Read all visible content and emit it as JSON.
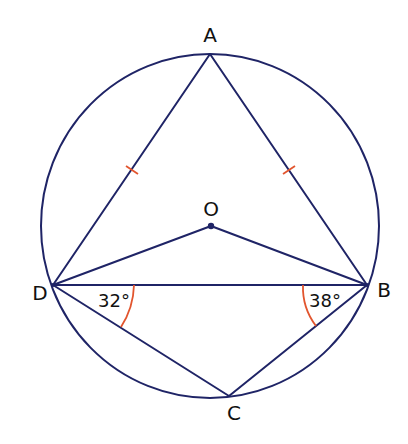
{
  "diagram": {
    "points": {
      "A": {
        "label": "A"
      },
      "B": {
        "label": "B"
      },
      "C": {
        "label": "C"
      },
      "D": {
        "label": "D"
      },
      "O": {
        "label": "O"
      }
    },
    "angles": {
      "BDC": {
        "label": "32°",
        "value_deg": 32
      },
      "DBC": {
        "label": "38°",
        "value_deg": 38
      }
    },
    "equal_sides": [
      "AD",
      "AB"
    ],
    "colors": {
      "line": "#1f2466",
      "marks": "#e2552e",
      "text": "#111111"
    }
  }
}
